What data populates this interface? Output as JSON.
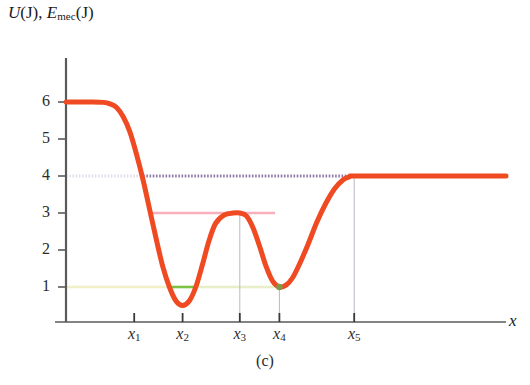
{
  "figure": {
    "caption": "(c)",
    "background_color": "#ffffff",
    "axis_color": "#5a5a5a"
  },
  "axes": {
    "y_title_main": "U",
    "y_title_unit_1": "(J),",
    "y_title_second": "E",
    "y_title_second_sub": "mec",
    "y_title_unit_2": "(J)",
    "x_title": "x",
    "y_ticks": [
      "6",
      "5",
      "4",
      "3",
      "2",
      "1"
    ],
    "y_tick_values": [
      6,
      5,
      4,
      3,
      2,
      1
    ],
    "x_ticks": [
      "x",
      "x",
      "x",
      "x",
      "x"
    ],
    "x_tick_subs": [
      "1",
      "2",
      "3",
      "4",
      "5"
    ]
  },
  "chart_data": {
    "type": "line",
    "title": "",
    "subtitle": "",
    "xlabel": "x",
    "ylabel": "U(J), E_mec(J)",
    "grid": false,
    "legend": null,
    "xlim": [
      0,
      10
    ],
    "ylim": [
      0,
      7
    ],
    "y_tick_labels": [
      "1",
      "2",
      "3",
      "4",
      "5",
      "6"
    ],
    "y_tick_values": [
      1,
      2,
      3,
      4,
      5,
      6
    ],
    "x_tick_labels": [
      "x1",
      "x2",
      "x3",
      "x4",
      "x5"
    ],
    "x_tick_values": [
      1.55,
      2.65,
      3.95,
      4.85,
      6.55
    ],
    "series": [
      {
        "name": "U(x) potential energy curve",
        "color": "#ef4a21",
        "width": 5,
        "points": [
          [
            0.0,
            6.0
          ],
          [
            0.55,
            6.0
          ],
          [
            0.85,
            5.99
          ],
          [
            1.0,
            5.95
          ],
          [
            1.15,
            5.85
          ],
          [
            1.3,
            5.6
          ],
          [
            1.45,
            5.2
          ],
          [
            1.6,
            4.6
          ],
          [
            1.75,
            3.9
          ],
          [
            1.9,
            3.1
          ],
          [
            2.05,
            2.3
          ],
          [
            2.2,
            1.55
          ],
          [
            2.35,
            1.0
          ],
          [
            2.5,
            0.62
          ],
          [
            2.65,
            0.5
          ],
          [
            2.8,
            0.62
          ],
          [
            2.95,
            1.0
          ],
          [
            3.1,
            1.6
          ],
          [
            3.25,
            2.25
          ],
          [
            3.4,
            2.72
          ],
          [
            3.6,
            2.95
          ],
          [
            3.8,
            3.0
          ],
          [
            3.95,
            3.0
          ],
          [
            4.1,
            2.92
          ],
          [
            4.25,
            2.6
          ],
          [
            4.4,
            2.1
          ],
          [
            4.55,
            1.55
          ],
          [
            4.7,
            1.15
          ],
          [
            4.85,
            1.0
          ],
          [
            5.0,
            1.05
          ],
          [
            5.15,
            1.25
          ],
          [
            5.3,
            1.6
          ],
          [
            5.5,
            2.15
          ],
          [
            5.7,
            2.75
          ],
          [
            5.9,
            3.25
          ],
          [
            6.1,
            3.65
          ],
          [
            6.3,
            3.9
          ],
          [
            6.45,
            3.98
          ],
          [
            6.55,
            4.0
          ],
          [
            7.5,
            4.0
          ],
          [
            10.0,
            4.0
          ]
        ]
      }
    ],
    "energy_levels": [
      {
        "name": "E_mec = 4 J (dotted, faint left segment)",
        "value": 4,
        "color": "#c9b6d6",
        "style": "dotted",
        "x_start": 0.0,
        "x_end": 1.68,
        "opacity": 0.45
      },
      {
        "name": "E_mec = 4 J (dotted, bold right segment)",
        "value": 4,
        "color": "#8d7aa8",
        "style": "dotted",
        "x_start": 1.68,
        "x_end": 6.55,
        "opacity": 1
      },
      {
        "name": "E_mec = 3 J",
        "value": 3,
        "color": "#f9aebc",
        "style": "solid",
        "x_start": 1.95,
        "x_end": 4.75,
        "opacity": 1
      },
      {
        "name": "E_mec = 1 J (faint left segment)",
        "value": 1,
        "color": "#f2f0c8",
        "style": "solid",
        "x_start": 0.0,
        "x_end": 2.32,
        "opacity": 1
      },
      {
        "name": "E_mec = 1 J (green turning-point segment)",
        "value": 1,
        "color": "#7dc242",
        "style": "solid",
        "x_start": 2.32,
        "x_end": 2.98,
        "opacity": 1
      },
      {
        "name": "E_mec = 1 J (faint right segment)",
        "value": 1,
        "color": "#e8eec8",
        "style": "solid",
        "x_start": 2.98,
        "x_end": 4.9,
        "opacity": 1
      }
    ],
    "drop_lines": [
      {
        "name": "guide-line-x3",
        "x": 3.95,
        "y_top": 3.0,
        "color": "#b9b9c4"
      },
      {
        "name": "guide-line-x4",
        "x": 4.85,
        "y_top": 1.0,
        "color": "#b9b9c4"
      },
      {
        "name": "guide-line-x5",
        "x": 6.55,
        "y_top": 4.0,
        "color": "#b9b9c4"
      }
    ],
    "markers": [
      {
        "name": "equilibrium-dot-x4",
        "x": 4.85,
        "y": 1.0,
        "color": "#7d9a4a",
        "r": 3.2
      }
    ],
    "annotations": []
  }
}
